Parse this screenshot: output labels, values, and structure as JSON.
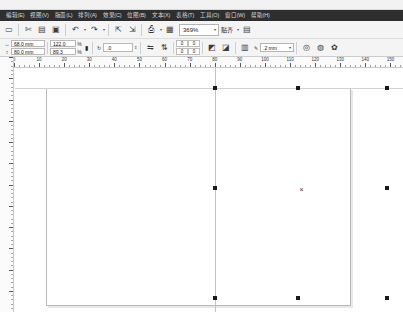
{
  "app": {
    "title": "Vector Graphics Editor"
  },
  "menubar": {
    "items": [
      {
        "label": "编辑(E)",
        "name": "menu-edit"
      },
      {
        "label": "视图(V)",
        "name": "menu-view"
      },
      {
        "label": "版面(L)",
        "name": "menu-layout"
      },
      {
        "label": "排列(A)",
        "name": "menu-arrange"
      },
      {
        "label": "效果(C)",
        "name": "menu-effects"
      },
      {
        "label": "位图(B)",
        "name": "menu-bitmap"
      },
      {
        "label": "文本(X)",
        "name": "menu-text"
      },
      {
        "label": "表格(T)",
        "name": "menu-table"
      },
      {
        "label": "工具(O)",
        "name": "menu-tools"
      },
      {
        "label": "窗口(W)",
        "name": "menu-window"
      },
      {
        "label": "帮助(H)",
        "name": "menu-help"
      }
    ]
  },
  "toolbar": {
    "buttons": [
      {
        "name": "new-document-icon",
        "glyph": "▭"
      },
      {
        "name": "cut-icon",
        "glyph": "✂"
      },
      {
        "name": "copy-icon",
        "glyph": "▤"
      },
      {
        "name": "paste-icon",
        "glyph": "▣"
      },
      {
        "name": "undo-icon",
        "glyph": "↶"
      },
      {
        "name": "redo-icon",
        "glyph": "↷"
      },
      {
        "name": "import-icon",
        "glyph": "⇱"
      },
      {
        "name": "export-icon",
        "glyph": "⇲"
      },
      {
        "name": "publish-pdf-icon",
        "glyph": "⎙"
      },
      {
        "name": "application-launcher-icon",
        "glyph": "▦"
      }
    ],
    "zoom_level": "369%",
    "snap_label": "贴齐",
    "options_icon": "▤"
  },
  "property_bar": {
    "width_value": "68.0 mm",
    "height_value": "80.0 mm",
    "width_icon": "↔",
    "height_icon": "↕",
    "scale_x": "122.0",
    "scale_y": "89.3",
    "percent_symbol": "%",
    "lock_icon": "🔒",
    "rotation_icon": "↻",
    "rotation_value": ".0",
    "mirror_h_icon": "⇋",
    "mirror_v_icon": "⇅",
    "nudge_x": "0",
    "nudge_y": "0",
    "nudge_x2": "0",
    "nudge_y2": "0",
    "outline_width": ".2 mm",
    "outline_icon": "✎",
    "wrap_icon": "▥",
    "to_front_icon": "◩",
    "to_back_icon": "◪",
    "convert_icon": "◎"
  },
  "rulers": {
    "unit": "mm",
    "h_labels": [
      "0",
      "10",
      "20",
      "30",
      "40",
      "50",
      "60",
      "70",
      "80",
      "90",
      "100",
      "110",
      "120",
      "130",
      "140",
      "150"
    ],
    "h_min": 0,
    "h_max": 155,
    "v_min": 0,
    "v_max": 120
  },
  "canvas": {
    "page": {
      "left": 31,
      "top": 20,
      "width": 305,
      "height": 218
    },
    "selection": {
      "handles": [
        {
          "name": "handle-top-left",
          "x": 198,
          "y": 18
        },
        {
          "name": "handle-top-center",
          "x": 281,
          "y": 18
        },
        {
          "name": "handle-top-right",
          "x": 370,
          "y": 18
        },
        {
          "name": "handle-middle-left",
          "x": 198,
          "y": 118
        },
        {
          "name": "handle-middle-right",
          "x": 370,
          "y": 118
        },
        {
          "name": "handle-bottom-left",
          "x": 198,
          "y": 228
        },
        {
          "name": "handle-bottom-center",
          "x": 281,
          "y": 228
        },
        {
          "name": "handle-bottom-right",
          "x": 370,
          "y": 228
        }
      ],
      "center_marker": {
        "x": 283,
        "y": 118,
        "glyph": "×"
      }
    },
    "guides": {
      "vertical_x": 200,
      "horizontal_y": 20
    }
  }
}
